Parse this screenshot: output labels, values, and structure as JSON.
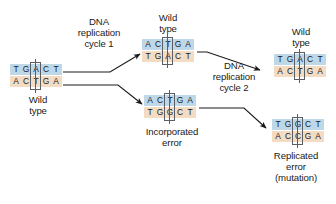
{
  "diagram": {
    "title_semantic": "dna-replication-mutation-diagram",
    "colors": {
      "top_strand": "#bfd8e8",
      "bottom_strand": "#f4dcc3",
      "arrow": "#1a1a1a",
      "box_outline": "#5a5f66",
      "text": "#1a1a1a",
      "background": "#ffffff"
    },
    "duplexes": [
      {
        "id": "wild-type-original",
        "top_bases": [
          "T",
          "G",
          "A",
          "C",
          "T"
        ],
        "bottom_bases": [
          "A",
          "C",
          "T",
          "G",
          "A"
        ],
        "highlight_index": 2,
        "label": "Wild\ntype",
        "label_position": "below"
      },
      {
        "id": "wild-type-cycle1",
        "top_bases": [
          "A",
          "C",
          "T",
          "G",
          "A"
        ],
        "bottom_bases": [
          "T",
          "G",
          "A",
          "C",
          "T"
        ],
        "highlight_index": 2,
        "label": "Wild\ntype",
        "label_position": "above"
      },
      {
        "id": "incorporated-error",
        "top_bases": [
          "A",
          "C",
          "T",
          "G",
          "A"
        ],
        "bottom_bases": [
          "T",
          "G",
          "G",
          "C",
          "T"
        ],
        "highlight_index": 2,
        "label": "Incorporated\nerror",
        "label_position": "below"
      },
      {
        "id": "wild-type-cycle2",
        "top_bases": [
          "T",
          "G",
          "A",
          "C",
          "T"
        ],
        "bottom_bases": [
          "A",
          "C",
          "T",
          "G",
          "A"
        ],
        "highlight_index": 2,
        "label": "Wild\ntype",
        "label_position": "above"
      },
      {
        "id": "replicated-error",
        "top_bases": [
          "T",
          "G",
          "G",
          "C",
          "T"
        ],
        "bottom_bases": [
          "A",
          "C",
          "C",
          "G",
          "A"
        ],
        "highlight_index": 2,
        "label": "Replicated\nerror\n(mutation)",
        "label_position": "below"
      }
    ],
    "process_labels": [
      {
        "id": "cycle-1",
        "text": "DNA\nreplication\ncycle 1"
      },
      {
        "id": "cycle-2",
        "text": "DNA\nreplication\ncycle 2"
      }
    ]
  }
}
